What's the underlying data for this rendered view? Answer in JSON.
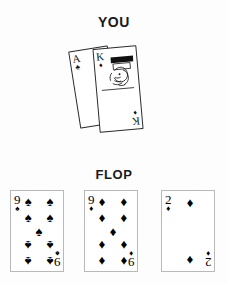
{
  "labels": {
    "you": "YOU",
    "flop": "FLOP"
  },
  "suits": {
    "spade": "♠",
    "heart": "♥",
    "diamond": "♦",
    "club": "♣"
  },
  "hole_cards": [
    {
      "rank": "A",
      "suit": "club",
      "suit_glyph": "♣",
      "name": "ace-of-clubs"
    },
    {
      "rank": "K",
      "suit": "diamond",
      "suit_glyph": "♦",
      "name": "king-of-diamonds"
    }
  ],
  "flop_cards": [
    {
      "rank": "9",
      "suit": "spade",
      "suit_glyph": "♠",
      "name": "nine-of-spades",
      "pip_count": 9
    },
    {
      "rank": "9",
      "suit": "diamond",
      "suit_glyph": "♦",
      "name": "nine-of-diamonds",
      "pip_count": 9
    },
    {
      "rank": "2",
      "suit": "diamond",
      "suit_glyph": "♦",
      "name": "two-of-diamonds",
      "pip_count": 2
    }
  ],
  "colors": {
    "ink": "#000000",
    "card_face": "#ffffff",
    "card_border_flop": "#b9b9b9",
    "card_border_hole": "#2a2a2a",
    "background": "#fdfdfd"
  }
}
